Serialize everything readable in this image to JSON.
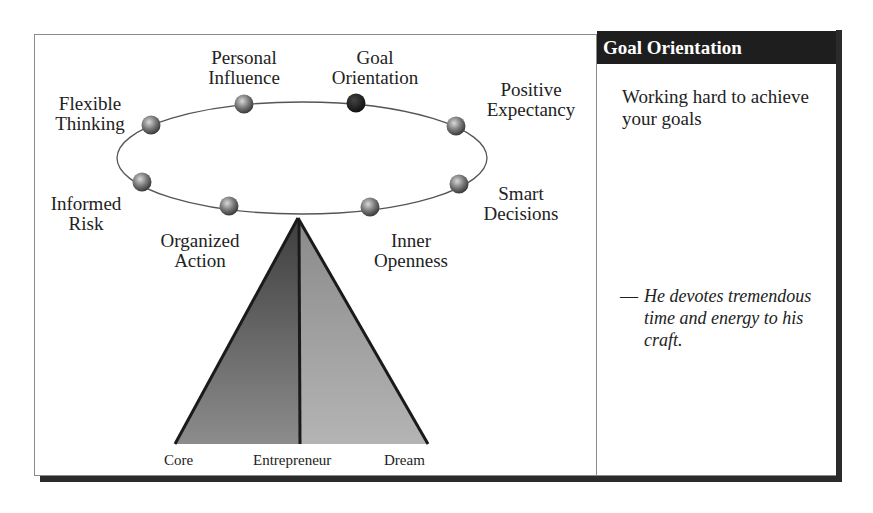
{
  "diagram": {
    "traits": [
      {
        "id": "personal-influence",
        "lines": [
          "Personal",
          "Influence"
        ],
        "highlighted": false
      },
      {
        "id": "goal-orientation",
        "lines": [
          "Goal",
          "Orientation"
        ],
        "highlighted": true
      },
      {
        "id": "positive-expectancy",
        "lines": [
          "Positive",
          "Expectancy"
        ],
        "highlighted": false
      },
      {
        "id": "flexible-thinking",
        "lines": [
          "Flexible",
          "Thinking"
        ],
        "highlighted": false
      },
      {
        "id": "smart-decisions",
        "lines": [
          "Smart",
          "Decisions"
        ],
        "highlighted": false
      },
      {
        "id": "informed-risk",
        "lines": [
          "Informed",
          "Risk"
        ],
        "highlighted": false
      },
      {
        "id": "organized-action",
        "lines": [
          "Organized",
          "Action"
        ],
        "highlighted": false
      },
      {
        "id": "inner-openness",
        "lines": [
          "Inner",
          "Openness"
        ],
        "highlighted": false
      }
    ],
    "pyramid": {
      "base_labels": {
        "left": "Core",
        "center": "Entrepreneur",
        "right": "Dream"
      }
    },
    "colors": {
      "sphere": "#7a7a7a",
      "sphere_highlight": "#1a1a1a",
      "pyramid_left": "#5c5c5c",
      "pyramid_right": "#9a9a9a",
      "outline": "#1a1a1a"
    }
  },
  "panel": {
    "title": "Goal Orientation",
    "description": "Working hard to achieve your goals",
    "quote_dash": "—",
    "quote": "He devotes tremendous time and energy to his craft."
  }
}
